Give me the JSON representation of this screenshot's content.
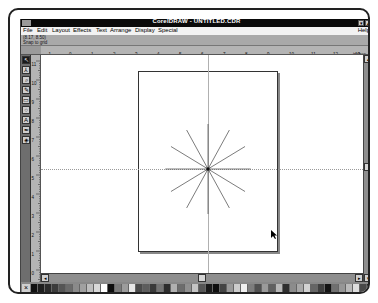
{
  "window": {
    "title": "CorelDRAW - UNTITLED.CDR",
    "minimize_glyph": "▾",
    "maximize_glyph": "▴"
  },
  "menu": {
    "items": [
      {
        "label": "File",
        "x": 2
      },
      {
        "label": "Edit",
        "x": 16
      },
      {
        "label": "Layout",
        "x": 32
      },
      {
        "label": "Effects",
        "x": 54
      },
      {
        "label": "Text",
        "x": 77
      },
      {
        "label": "Arrange",
        "x": 92
      },
      {
        "label": "Display",
        "x": 118
      },
      {
        "label": "Special",
        "x": 142
      }
    ],
    "help": "Help"
  },
  "status": {
    "coordinates": "(8.17, 8.50)",
    "mode": "Snap to grid"
  },
  "ruler": {
    "horizontal_labels": [
      "-1",
      "0",
      "1",
      "2",
      "3",
      "4",
      "5",
      "6",
      "7",
      "8",
      "9",
      "10",
      "11",
      "12",
      "13"
    ],
    "unit": "inches",
    "vertical_labels": [
      "11",
      "10",
      "9",
      "8",
      "7",
      "6",
      "5",
      "4",
      "3",
      "2",
      "1",
      "0"
    ]
  },
  "toolbox": {
    "tools": [
      {
        "name": "pick-tool",
        "glyph": "↖"
      },
      {
        "name": "shape-tool",
        "glyph": "⅄"
      },
      {
        "name": "zoom-tool",
        "glyph": "⌕"
      },
      {
        "name": "pencil-tool",
        "glyph": "✎"
      },
      {
        "name": "rectangle-tool",
        "glyph": "▭"
      },
      {
        "name": "ellipse-tool",
        "glyph": "○"
      },
      {
        "name": "text-tool",
        "glyph": "A"
      },
      {
        "name": "outline-tool",
        "glyph": "✒"
      },
      {
        "name": "fill-tool",
        "glyph": "◈"
      }
    ]
  },
  "drawing": {
    "object": "star-burst",
    "spokes": 12,
    "center": [
      167,
      114
    ],
    "radius": 45
  },
  "palette": {
    "no_color": "×",
    "swatches": [
      "#111111",
      "#1e1e1e",
      "#2a2a2a",
      "#3b3b3b",
      "#555555",
      "#6a6a6a",
      "#8a8a8a",
      "#a0a0a0",
      "#bdbdbd",
      "#d8d8d8",
      "#ffffff",
      "#0d0d0d",
      "#7a7a7a",
      "#9c9c9c",
      "#e6e6e6",
      "#4a4a4a",
      "#5d5d5d",
      "#3a3a3a",
      "#747474",
      "#2c2c2c",
      "#b0b0b0",
      "#6c6c6c",
      "#8f8f8f",
      "#c4c4c4",
      "#565656",
      "#1a1a1a",
      "#0f0f0f",
      "#444444",
      "#999999",
      "#cccccc",
      "#efefef",
      "#7d7d7d",
      "#505050",
      "#9a9a9a",
      "#606060",
      "#b8b8b8",
      "#2e2e2e",
      "#8c8c8c",
      "#a8a8a8",
      "#d2d2d2",
      "#656565",
      "#3f3f3f",
      "#131313",
      "#707070",
      "#969696",
      "#bababa",
      "#dedede",
      "#484848",
      "#1b1b1b",
      "#5a5a5a"
    ]
  }
}
